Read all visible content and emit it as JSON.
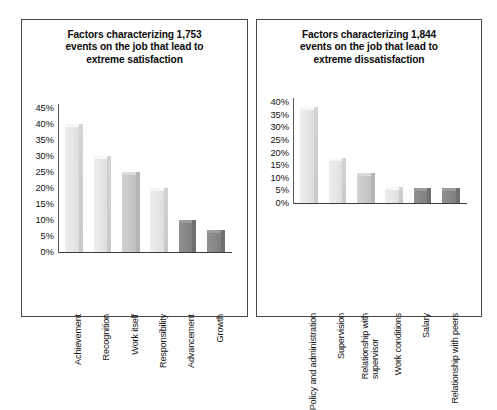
{
  "figure": {
    "background": "#ffffff",
    "border_color": "#4a4a4a"
  },
  "panels": [
    {
      "id": "satisfaction",
      "title_lines": [
        "Factors characterizing 1,753",
        "events on the job that lead to",
        "extreme satisfaction"
      ],
      "title_full": "Factors characterizing 1,753 events on the job that lead to extreme satisfaction"
    },
    {
      "id": "dissatisfaction",
      "title_lines": [
        "Factors characterizing 1,844",
        "events on the job that lead to",
        "extreme dissatisfaction"
      ],
      "title_full": "Factors characterizing 1,844 events on the job that lead to extreme dissatisfaction"
    }
  ],
  "chart_data": [
    {
      "type": "bar",
      "id": "satisfaction",
      "title": "Factors characterizing 1,753 events on the job that lead to extreme satisfaction",
      "xlabel": "",
      "ylabel": "",
      "ylim": [
        0,
        45
      ],
      "ytick_values": [
        0,
        5,
        10,
        15,
        20,
        25,
        30,
        35,
        40,
        45
      ],
      "ytick_labels": [
        "0%",
        "5%",
        "10%",
        "15%",
        "20%",
        "25%",
        "30%",
        "35%",
        "40%",
        "45%"
      ],
      "grid": false,
      "legend": "none",
      "categories": [
        "Achievement",
        "Recognition",
        "Work itself",
        "Responsibility",
        "Advancement",
        "Growth"
      ],
      "category_lines": [
        [
          "Achievement"
        ],
        [
          "Recognition"
        ],
        [
          "Work itself"
        ],
        [
          "Responsibility"
        ],
        [
          "Advancement"
        ],
        [
          "Growth"
        ]
      ],
      "values": [
        40,
        30,
        25,
        20,
        10,
        7
      ],
      "bar_shades": [
        "light",
        "light",
        "mid",
        "light",
        "dark",
        "dark"
      ],
      "event_count": "1,753"
    },
    {
      "type": "bar",
      "id": "dissatisfaction",
      "title": "Factors characterizing 1,844 events on the job that lead to extreme dissatisfaction",
      "xlabel": "",
      "ylabel": "",
      "ylim": [
        0,
        40
      ],
      "ytick_values": [
        0,
        5,
        10,
        15,
        20,
        25,
        30,
        35,
        40
      ],
      "ytick_labels": [
        "0%",
        "5%",
        "10%",
        "15%",
        "20%",
        "25%",
        "30%",
        "35%",
        "40%"
      ],
      "grid": false,
      "legend": "none",
      "categories": [
        "Policy and administration",
        "Supervision",
        "Relationship with supervisor",
        "Work conditions",
        "Salary",
        "Relationship with peers"
      ],
      "category_lines": [
        [
          "Policy and administration"
        ],
        [
          "Supervision"
        ],
        [
          "Relationship with",
          "supervisor"
        ],
        [
          "Work conditions"
        ],
        [
          "Salary"
        ],
        [
          "Relationship with peers"
        ]
      ],
      "values": [
        38,
        18,
        12,
        6.5,
        6,
        6
      ],
      "bar_shades": [
        "light",
        "light",
        "mid",
        "light",
        "dark",
        "dark"
      ],
      "event_count": "1,844"
    }
  ]
}
